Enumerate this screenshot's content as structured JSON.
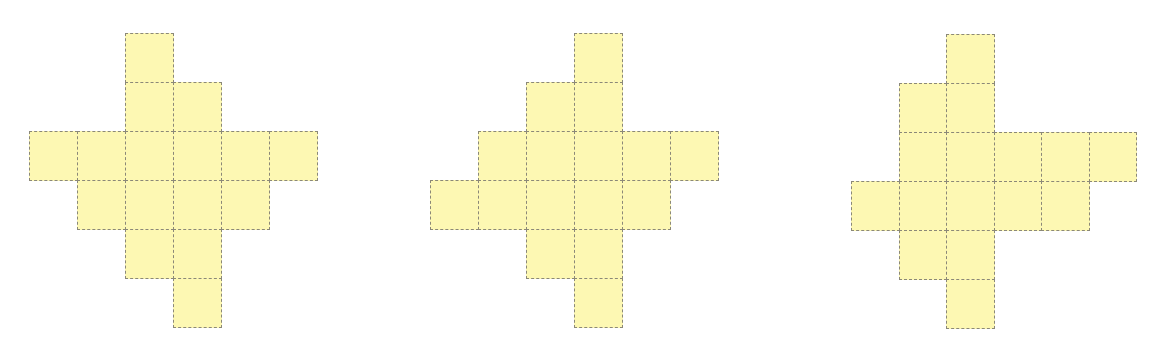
{
  "colors": {
    "background": "#ffffff",
    "cell_fill": "#fdf8b3",
    "cell_border": "#8b8878"
  },
  "figures": [
    {
      "id": "figure-1",
      "origin": {
        "x": 29,
        "y": 33
      },
      "cell_w": 48,
      "cell_h": 49,
      "rows": [
        [
          2
        ],
        [
          2,
          3
        ],
        [
          0,
          1,
          2,
          3,
          4,
          5
        ],
        [
          1,
          2,
          3,
          4
        ],
        [
          2,
          3
        ],
        [
          3
        ]
      ]
    },
    {
      "id": "figure-2",
      "origin": {
        "x": 430,
        "y": 33
      },
      "cell_w": 48,
      "cell_h": 49,
      "rows": [
        [
          3
        ],
        [
          2,
          3
        ],
        [
          1,
          2,
          3,
          4,
          5
        ],
        [
          0,
          1,
          2,
          3,
          4
        ],
        [
          2,
          3
        ],
        [
          3
        ]
      ]
    },
    {
      "id": "figure-3",
      "origin": {
        "x": 851,
        "y": 34
      },
      "cell_w": 47.5,
      "cell_h": 49,
      "rows": [
        [
          2
        ],
        [
          1,
          2
        ],
        [
          1,
          2,
          3,
          4,
          5
        ],
        [
          0,
          1,
          2,
          3,
          4
        ],
        [
          1,
          2
        ],
        [
          2
        ]
      ]
    }
  ]
}
